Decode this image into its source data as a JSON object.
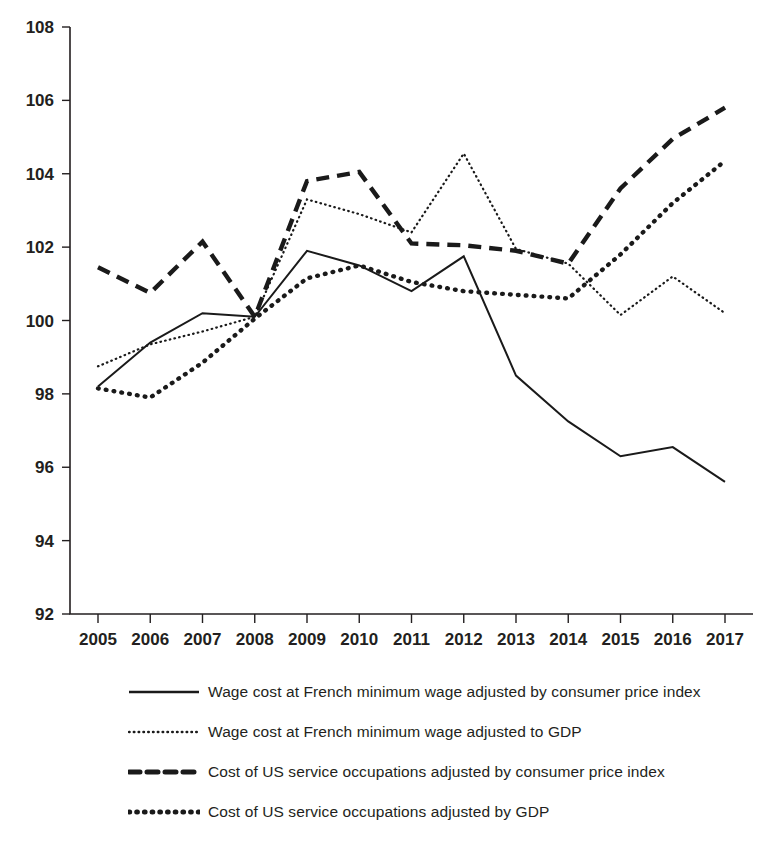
{
  "chart_data": {
    "type": "line",
    "title": "",
    "subtitle": "",
    "xlabel": "",
    "ylabel": "",
    "xlim": [
      2005,
      2017
    ],
    "ylim": [
      92,
      108
    ],
    "yticks": [
      92,
      94,
      96,
      98,
      100,
      102,
      104,
      106,
      108
    ],
    "grid": false,
    "legend_position": "below",
    "categories": [
      2005,
      2006,
      2007,
      2008,
      2009,
      2010,
      2011,
      2012,
      2013,
      2014,
      2015,
      2016,
      2017
    ],
    "x": [
      "2005",
      "2006",
      "2007",
      "2008",
      "2009",
      "2010",
      "2011",
      "2012",
      "2013",
      "2014",
      "2015",
      "2016",
      "2017"
    ],
    "series": [
      {
        "name": "Wage cost at French minimum wage adjusted by consumer price index",
        "style": "solid",
        "color": "#1a1a1a",
        "values": [
          98.2,
          99.4,
          100.2,
          100.1,
          101.9,
          101.5,
          100.8,
          101.75,
          98.5,
          97.25,
          96.3,
          96.55,
          95.6
        ]
      },
      {
        "name": "Wage cost at French minimum wage adjusted to GDP",
        "style": "fine-dotted",
        "color": "#1a1a1a",
        "values": [
          98.75,
          99.35,
          99.7,
          100.1,
          103.3,
          102.9,
          102.4,
          104.55,
          101.95,
          101.55,
          100.15,
          101.2,
          100.2
        ]
      },
      {
        "name": "Cost of US service occupations adjusted by consumer price index",
        "style": "bold-dashed",
        "color": "#1a1a1a",
        "values": [
          101.45,
          100.75,
          102.15,
          100.1,
          103.8,
          104.05,
          102.1,
          102.05,
          101.9,
          101.55,
          103.6,
          104.95,
          105.8
        ]
      },
      {
        "name": "Cost of US service occupations adjusted by GDP",
        "style": "bold-dotted",
        "color": "#1a1a1a",
        "values": [
          98.15,
          97.9,
          98.85,
          100.05,
          101.15,
          101.5,
          101.05,
          100.8,
          100.7,
          100.6,
          101.8,
          103.2,
          104.35
        ]
      }
    ]
  },
  "legend": {
    "items": [
      {
        "label": "Wage cost at French minimum wage adjusted by consumer price index",
        "style": "solid"
      },
      {
        "label": "Wage cost at French minimum wage adjusted to GDP",
        "style": "fine-dotted"
      },
      {
        "label": "Cost of US service occupations adjusted by consumer price index",
        "style": "bold-dashed"
      },
      {
        "label": "Cost of US service occupations adjusted by GDP",
        "style": "bold-dotted"
      }
    ]
  }
}
